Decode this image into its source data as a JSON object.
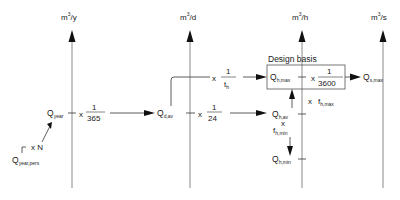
{
  "axes": [
    {
      "unit_base": "m",
      "unit_exp": "3",
      "unit_per": "/y"
    },
    {
      "unit_base": "m",
      "unit_exp": "3",
      "unit_per": "/d"
    },
    {
      "unit_base": "m",
      "unit_exp": "3",
      "unit_per": "/h"
    },
    {
      "unit_base": "m",
      "unit_exp": "3",
      "unit_per": "/s"
    }
  ],
  "design_basis_label": "Design basis",
  "nodes": {
    "q_year_pers": {
      "main": "Q",
      "sub": "year,pers"
    },
    "q_year": {
      "main": "Q",
      "sub": "year"
    },
    "q_d_av": {
      "main": "Q",
      "sub": "d,av"
    },
    "q_h_max": {
      "main": "Q",
      "sub": "h,max"
    },
    "q_h_av": {
      "main": "Q",
      "sub": "h,av"
    },
    "q_h_min": {
      "main": "Q",
      "sub": "h,min"
    },
    "q_s_max": {
      "main": "Q",
      "sub": "s,max"
    }
  },
  "factors": {
    "times": "x",
    "x_n": "x N",
    "one": "1",
    "days": "365",
    "hours": "24",
    "seconds": "3600",
    "t_h_main": "t",
    "t_h_sub": "h",
    "f_max_main": "f",
    "f_max_sub": "h,max",
    "f_min_main": "f",
    "f_min_sub": "h,min"
  }
}
